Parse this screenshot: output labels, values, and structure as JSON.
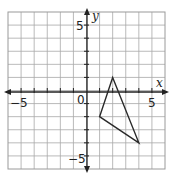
{
  "chart_data": {
    "type": "scatter",
    "title": "",
    "xlabel": "x",
    "ylabel": "y",
    "xlim": [
      -6,
      6
    ],
    "ylim": [
      -6,
      6
    ],
    "grid": true,
    "x_tick_labels": [
      "-5",
      "5"
    ],
    "y_tick_labels": [
      "5",
      "-5"
    ],
    "origin_label": "0",
    "shape": {
      "kind": "triangle",
      "vertices": [
        {
          "x": 2,
          "y": 1
        },
        {
          "x": 1,
          "y": -2
        },
        {
          "x": 4,
          "y": -4
        }
      ]
    }
  },
  "labels": {
    "x_axis": "x",
    "y_axis": "y",
    "origin": "0",
    "x_neg5": "−5",
    "x_pos5": "5",
    "y_pos5": "5",
    "y_neg5": "−5"
  },
  "colors": {
    "grid": "#a8a8a8",
    "axis": "#222222",
    "shape": "#2a2a2a"
  }
}
